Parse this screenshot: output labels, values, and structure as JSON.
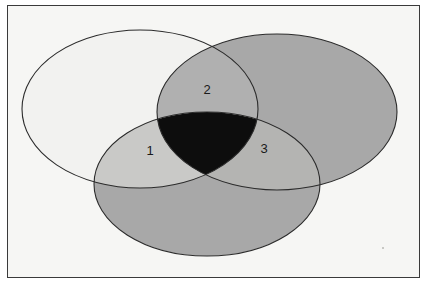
{
  "figure": {
    "type": "venn-diagram",
    "set_count": 3,
    "background_color": "#f6f6f4",
    "frame_color": "#3a3a3a",
    "outline_color": "#2b2b2b",
    "page_color": "#ffffff"
  },
  "ellipses": [
    {
      "id": "set-left",
      "name": "left-set-ellipse",
      "cx": 140,
      "cy": 109,
      "rx": 118,
      "ry": 79,
      "fill": "#f2f2f0",
      "opacity": 1
    },
    {
      "id": "set-right",
      "name": "right-set-ellipse",
      "cx": 277,
      "cy": 112,
      "rx": 120,
      "ry": 78,
      "fill": "#a8a8a8",
      "opacity": 1
    },
    {
      "id": "set-bottom",
      "name": "bottom-set-ellipse",
      "cx": 207,
      "cy": 184,
      "rx": 113,
      "ry": 72,
      "fill": "#a8a8a8",
      "opacity": 1
    }
  ],
  "regions": [
    {
      "id": "region-left-bottom",
      "name": "left-bottom-intersection",
      "label": "1",
      "label_x": 150,
      "label_y": 152,
      "fill": "#c9c9c7",
      "description": "intersection of left and bottom sets"
    },
    {
      "id": "region-left-right",
      "name": "left-right-intersection",
      "label": "2",
      "label_x": 207,
      "label_y": 91,
      "fill": "#b0b0b0",
      "description": "intersection of left and right sets"
    },
    {
      "id": "region-right-bottom",
      "name": "right-bottom-intersection",
      "label": "3",
      "label_x": 264,
      "label_y": 150,
      "fill": "#b4b4b2",
      "description": "intersection of right and bottom sets"
    },
    {
      "id": "region-center",
      "name": "triple-intersection",
      "label": "",
      "fill": "#0d0d0d",
      "description": "intersection of all three sets, filled solid black"
    }
  ],
  "labels": [
    {
      "text": "1",
      "x": 150,
      "y": 152
    },
    {
      "text": "2",
      "x": 207,
      "y": 91
    },
    {
      "text": "3",
      "x": 264,
      "y": 150
    }
  ]
}
